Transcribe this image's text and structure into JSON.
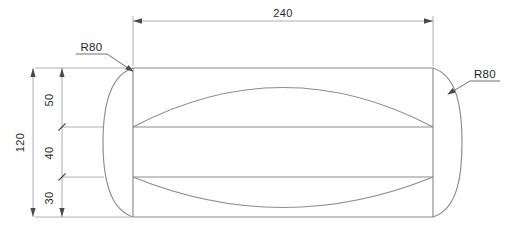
{
  "drawing": {
    "title": "Rounded-end plate with arc features",
    "units_implied": "mm",
    "colors": {
      "geometry_line": "#8c8c8c",
      "dimension_line": "#9a9a9a",
      "leader_line": "#555555",
      "text": "#1f1f1f",
      "background": "#ffffff"
    },
    "dimensions": {
      "overall_width": {
        "label": "240",
        "orientation": "horizontal",
        "position": "top"
      },
      "overall_height": {
        "label": "120",
        "orientation": "vertical",
        "position": "left-outer"
      },
      "segment_top": {
        "label": "50",
        "orientation": "vertical",
        "position": "left-inner"
      },
      "segment_middle": {
        "label": "40",
        "orientation": "vertical",
        "position": "left-inner"
      },
      "segment_bottom": {
        "label": "30",
        "orientation": "vertical",
        "position": "left-inner"
      }
    },
    "radii": {
      "left": {
        "label": "R80",
        "position": "upper-left"
      },
      "right": {
        "label": "R80",
        "position": "upper-right"
      }
    }
  }
}
